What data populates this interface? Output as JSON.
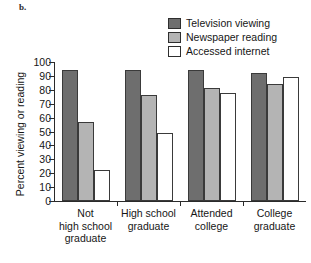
{
  "panel": {
    "label": "b."
  },
  "legend": {
    "position": "top-right",
    "items": [
      {
        "name": "Television viewing",
        "color": "#6e6e6e"
      },
      {
        "name": "Newspaper reading",
        "color": "#b4b4b4"
      },
      {
        "name": "Accessed internet",
        "color": "#ffffff"
      }
    ]
  },
  "axes": {
    "ylabel": "Percent viewing or reading",
    "xlabel": "",
    "yticks": [
      "100",
      "90",
      "80",
      "70",
      "60",
      "50",
      "40",
      "30",
      "20",
      "10",
      "0"
    ]
  },
  "categories_lines": [
    [
      "Not",
      "high school",
      "graduate"
    ],
    [
      "High school",
      "graduate"
    ],
    [
      "Attended",
      "college"
    ],
    [
      "College",
      "graduate"
    ]
  ],
  "chart_data": {
    "type": "bar",
    "title": "",
    "subtitle": "",
    "xlabel": "",
    "ylabel": "Percent viewing or reading",
    "ylim": [
      0,
      100
    ],
    "ytick_step": 10,
    "grid": false,
    "legend_position": "top-right",
    "categories": [
      "Not high school graduate",
      "High school graduate",
      "Attended college",
      "College graduate"
    ],
    "series": [
      {
        "name": "Television viewing",
        "color": "#6e6e6e",
        "values": [
          94,
          94,
          94,
          92
        ]
      },
      {
        "name": "Newspaper reading",
        "color": "#b4b4b4",
        "values": [
          57,
          76,
          81,
          84
        ]
      },
      {
        "name": "Accessed internet",
        "color": "#ffffff",
        "values": [
          22,
          49,
          78,
          89
        ]
      }
    ]
  }
}
